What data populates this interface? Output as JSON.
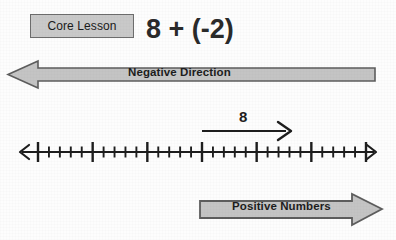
{
  "lesson": {
    "badge_label": "Core Lesson",
    "expression": "8 + (-2)"
  },
  "banners": {
    "negative": {
      "label": "Negative Direction",
      "direction": "left",
      "fill_color": "#c4c4c4",
      "stroke_color": "#5d5d5d"
    },
    "positive": {
      "label": "Positive Numbers",
      "direction": "right",
      "fill_color": "#c4c4c4",
      "stroke_color": "#5d5d5d"
    }
  },
  "number_line": {
    "min": -15,
    "max": 15,
    "major_step": 5,
    "minor_step": 1,
    "major_labels": [
      "-15",
      "-10",
      "-5",
      "0",
      "5",
      "10",
      "15"
    ],
    "major_values": [
      -15,
      -10,
      -5,
      0,
      5,
      10,
      15
    ],
    "left_arrow": true,
    "right_arrow": true,
    "line_color": "#1d1d1d"
  },
  "jump_arrow": {
    "label": "8",
    "start_value": 0,
    "end_value": 8,
    "direction": "right",
    "color": "#1e1e1e"
  },
  "chart_data": {
    "type": "line",
    "title": "8 + (-2)",
    "xlabel": "",
    "ylabel": "",
    "xlim": [
      -15,
      15
    ],
    "ticks": [
      -15,
      -14,
      -13,
      -12,
      -11,
      -10,
      -9,
      -8,
      -7,
      -6,
      -5,
      -4,
      -3,
      -2,
      -1,
      0,
      1,
      2,
      3,
      4,
      5,
      6,
      7,
      8,
      9,
      10,
      11,
      12,
      13,
      14,
      15
    ],
    "major_ticks": [
      -15,
      -10,
      -5,
      0,
      5,
      10,
      15
    ],
    "tick_labels": [
      "-15",
      "-10",
      "-5",
      "0",
      "5",
      "10",
      "15"
    ],
    "grid": false,
    "annotations": [
      {
        "text": "8",
        "from": 0,
        "to": 8,
        "type": "arrow",
        "direction": "right"
      },
      {
        "text": "Negative Direction",
        "type": "banner",
        "direction": "left"
      },
      {
        "text": "Positive Numbers",
        "type": "banner",
        "direction": "right"
      }
    ]
  }
}
